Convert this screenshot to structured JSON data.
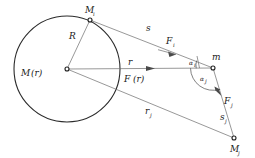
{
  "figure": {
    "background_color": "#ffffff",
    "line_color": "#6b6b6b",
    "circle_color": "#2b2b2b",
    "label_color": "#1a1a1a",
    "width": 255,
    "height": 158
  },
  "labels": {
    "center_mass": {
      "base": "M",
      "arg": "(r)"
    },
    "shell_point_upper": {
      "base": "M",
      "sub": "i"
    },
    "shell_point_lower": {
      "base": "M",
      "sub": "j"
    },
    "test_mass": {
      "base": "m"
    },
    "radius": {
      "base": "R"
    },
    "distance_r": {
      "base": "r"
    },
    "distance_s": {
      "base": "s"
    },
    "distance_sj": {
      "base": "s",
      "sub": "j"
    },
    "distance_rj": {
      "base": "r",
      "sub": "j"
    },
    "force_resultant": {
      "base": "F",
      "arg": "(r)"
    },
    "force_i": {
      "base": "F",
      "sub": "i"
    },
    "force_j": {
      "base": "F",
      "sub": "j"
    },
    "angle_i": {
      "base": "α",
      "sub": "i"
    },
    "angle_j": {
      "base": "α",
      "sub": "j"
    }
  },
  "geometry": {
    "circle": {
      "cx": 67,
      "cy": 69,
      "r": 53
    },
    "points": {
      "M_center": [
        67,
        69
      ],
      "M_i": [
        90,
        20
      ],
      "m": [
        213,
        68
      ],
      "M_j": [
        234,
        138
      ]
    },
    "segments": [
      {
        "name": "radius-R",
        "from": [
          67,
          69
        ],
        "to": [
          90,
          20
        ]
      },
      {
        "name": "line-s",
        "from": [
          90,
          20
        ],
        "to": [
          213,
          68
        ]
      },
      {
        "name": "line-r",
        "from": [
          67,
          69
        ],
        "to": [
          213,
          68
        ]
      },
      {
        "name": "line-rj",
        "from": [
          67,
          69
        ],
        "to": [
          234,
          138
        ]
      },
      {
        "name": "line-sj",
        "from": [
          213,
          68
        ],
        "to": [
          234,
          138
        ]
      }
    ]
  }
}
